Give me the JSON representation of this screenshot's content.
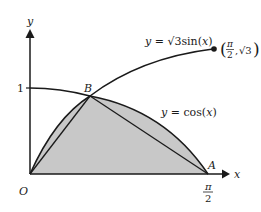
{
  "diagram": {
    "type": "function-graph",
    "axes": {
      "x_label": "x",
      "y_label": "y",
      "origin_label": "O",
      "y_tick_label": "1",
      "x_tick_label_num": "π",
      "x_tick_label_den": "2"
    },
    "curves": [
      {
        "name": "sine",
        "label": "y = √3sin(x)",
        "end_point_label_num": "π",
        "end_point_label_den": "2",
        "end_point_label_y": "√3"
      },
      {
        "name": "cosine",
        "label": "y = cos(x)"
      }
    ],
    "points": [
      {
        "name": "B",
        "label": "B"
      },
      {
        "name": "A",
        "label": "A"
      },
      {
        "name": "O",
        "label": "O"
      }
    ],
    "colors": {
      "stroke": "#1a1a1a",
      "shaded_region": "#c8c8c8",
      "background": "#ffffff"
    }
  }
}
